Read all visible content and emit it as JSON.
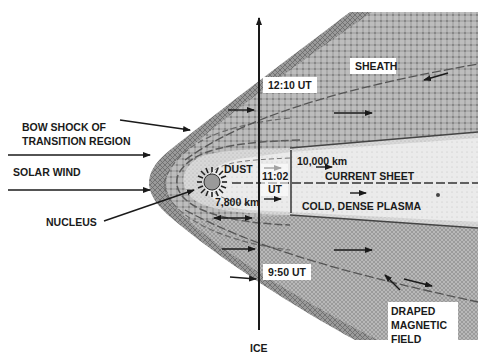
{
  "diagram": {
    "labels": {
      "bow_shock": [
        "BOW SHOCK OF",
        "TRANSITION REGION"
      ],
      "solar_wind": "SOLAR WIND",
      "nucleus": "NUCLEUS",
      "dust": "DUST",
      "time_1102": [
        "11:02",
        "UT"
      ],
      "time_1210": "12:10 UT",
      "time_0950": "9:50 UT",
      "sheath": "SHEATH",
      "dist_10000": "10,000 km",
      "dist_7800": "7,800 km",
      "current_sheet": "CURRENT SHEET",
      "cold_plasma": "COLD, DENSE PLASMA",
      "draped_field": [
        "DRAPED",
        "MAGNETIC",
        "FIELD"
      ],
      "ice": "ICE"
    },
    "colors": {
      "background": "#ffffff",
      "ink": "#1a1a1a",
      "sheath_fill": "#b4b4b4",
      "bow_band_fill": "#8c8c8c",
      "inner_fill": "#dcdcdc",
      "core_fill": "#ececec"
    }
  }
}
